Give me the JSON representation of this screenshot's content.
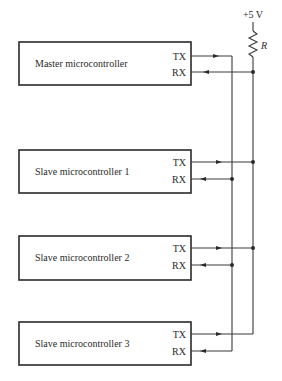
{
  "diagram": {
    "supply": {
      "label": "+5 V",
      "resistor_label": "R"
    },
    "controllers": [
      {
        "name": "Master microcontroller",
        "tx": "TX",
        "rx": "RX"
      },
      {
        "name": "Slave microcontroller 1",
        "tx": "TX",
        "rx": "RX"
      },
      {
        "name": "Slave microcontroller 2",
        "tx": "TX",
        "rx": "RX"
      },
      {
        "name": "Slave microcontroller 3",
        "tx": "TX",
        "rx": "RX"
      }
    ]
  }
}
